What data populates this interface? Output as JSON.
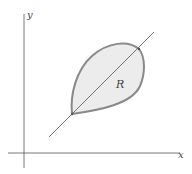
{
  "diagram": {
    "axes": {
      "x_label": "x",
      "y_label": "y"
    },
    "region": {
      "label": "R",
      "fill_color": "#ececec",
      "stroke_color": "#8a8a8a"
    },
    "line": {
      "color": "#555555"
    },
    "axis_color": "#555555"
  }
}
